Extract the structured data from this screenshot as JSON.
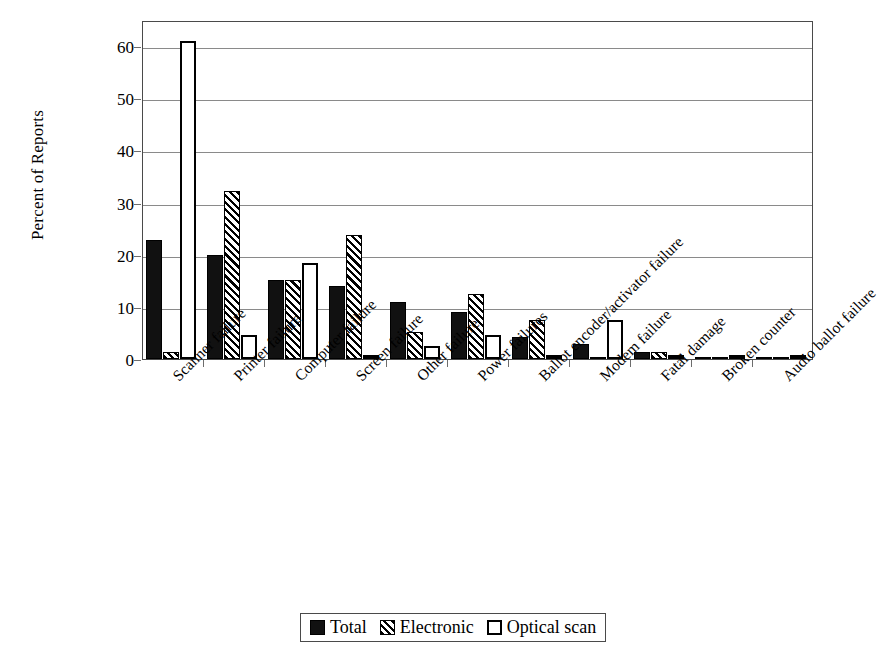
{
  "chart_data": {
    "type": "bar",
    "title": "",
    "xlabel": "",
    "ylabel": "Percent of Reports",
    "ylim": [
      0,
      65
    ],
    "yticks": [
      0,
      10,
      20,
      30,
      40,
      50,
      60
    ],
    "grid": true,
    "legend_position": "bottom",
    "categories": [
      "Scanner failure",
      "Printer failure",
      "Computer failure",
      "Screen failure",
      "Other failure",
      "Power failures",
      "Ballot encoder/activator failure",
      "Modem failure",
      "Fatal damage",
      "Broken counter",
      "Audio ballot failure"
    ],
    "series": [
      {
        "name": "Total",
        "pattern": "solid-black",
        "values": [
          22.8,
          20.0,
          15.2,
          14.0,
          11.0,
          9.0,
          4.3,
          2.9,
          1.4,
          0.3,
          0.3
        ]
      },
      {
        "name": "Electronic",
        "pattern": "diagonal-hatch",
        "values": [
          1.3,
          32.3,
          15.1,
          23.8,
          5.1,
          12.4,
          7.5,
          0.0,
          1.3,
          0.3,
          0.3
        ]
      },
      {
        "name": "Optical scan",
        "pattern": "white-outline",
        "values": [
          61.0,
          4.7,
          18.4,
          0.7,
          2.4,
          4.6,
          0.8,
          7.5,
          0.2,
          0.3,
          0.5
        ]
      }
    ]
  },
  "axis": {
    "y_title": "Percent of Reports",
    "y_tick_labels": [
      "0",
      "10",
      "20",
      "30",
      "40",
      "50",
      "60"
    ]
  },
  "legend": {
    "items": [
      {
        "label": "Total",
        "swatch": "solid-black-square-icon"
      },
      {
        "label": "Electronic",
        "swatch": "hatched-square-icon"
      },
      {
        "label": "Optical scan",
        "swatch": "white-square-icon"
      }
    ]
  }
}
